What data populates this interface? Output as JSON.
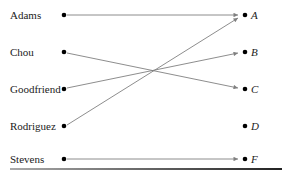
{
  "diagram": {
    "type": "mapping",
    "domain": [
      {
        "label": "Adams",
        "y": 15
      },
      {
        "label": "Chou",
        "y": 52
      },
      {
        "label": "Goodfriend",
        "y": 89
      },
      {
        "label": "Rodriguez",
        "y": 126
      },
      {
        "label": "Stevens",
        "y": 159
      }
    ],
    "codomain": [
      {
        "label": "A",
        "y": 15
      },
      {
        "label": "B",
        "y": 52
      },
      {
        "label": "C",
        "y": 89
      },
      {
        "label": "D",
        "y": 126
      },
      {
        "label": "F",
        "y": 159
      }
    ],
    "arrows": [
      {
        "from": "Adams",
        "to": "A"
      },
      {
        "from": "Chou",
        "to": "C"
      },
      {
        "from": "Goodfriend",
        "to": "B"
      },
      {
        "from": "Rodriguez",
        "to": "A"
      },
      {
        "from": "Stevens",
        "to": "F"
      }
    ],
    "colors": {
      "dot": "#000000",
      "arrow": "#808080",
      "text": "#222222"
    }
  }
}
